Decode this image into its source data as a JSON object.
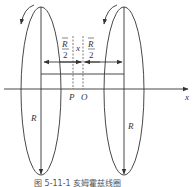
{
  "diagram": {
    "labels": {
      "axis": "x",
      "point_p": "P",
      "point_o": "O",
      "radius_left": "R",
      "radius_right": "R",
      "half_sep_num": "R",
      "half_sep_den": "2",
      "offset": "x"
    },
    "caption": "图 5-11-1  亥姆霍兹线圈",
    "coils": [
      {
        "name": "left-coil",
        "current_direction": "counterclockwise-arrow"
      },
      {
        "name": "right-coil",
        "current_direction": "counterclockwise-arrow"
      }
    ]
  }
}
